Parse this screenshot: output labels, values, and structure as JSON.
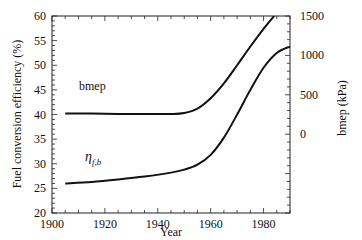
{
  "chart_data": {
    "type": "line",
    "title": "",
    "xlabel": "Year",
    "ylabel": "Fuel conversion efficiency (%)",
    "ylabel_right": "bmep (kPa)",
    "xlim": [
      1900,
      1990
    ],
    "ylim": [
      20,
      60
    ],
    "ylim_right": [
      -1000,
      1500
    ],
    "x_ticks": [
      1900,
      1920,
      1940,
      1960,
      1980
    ],
    "y_ticks": [
      20,
      25,
      30,
      35,
      40,
      45,
      50,
      55,
      60
    ],
    "y_ticks_right": [
      0,
      500,
      1000,
      1500
    ],
    "grid": false,
    "legend": "inline labels",
    "series": [
      {
        "name": "bmep",
        "axis": "right",
        "label": "bmep",
        "x": [
          1905,
          1915,
          1925,
          1935,
          1945,
          1950,
          1955,
          1960,
          1965,
          1970,
          1975,
          1980,
          1984
        ],
        "y_left_scale": [
          40.2,
          40.2,
          40.1,
          40.1,
          40.1,
          40.3,
          41.2,
          43.3,
          46.3,
          50.0,
          53.8,
          57.4,
          60.0
        ],
        "values_kpa": [
          500,
          500,
          500,
          500,
          500,
          510,
          580,
          750,
          990,
          1250,
          1500,
          1620,
          1700
        ]
      },
      {
        "name": "eta_f,b",
        "axis": "left",
        "label": "η",
        "label_sub": "f,b",
        "x": [
          1905,
          1915,
          1925,
          1935,
          1945,
          1950,
          1955,
          1960,
          1965,
          1970,
          1975,
          1980,
          1985,
          1990
        ],
        "values": [
          26.0,
          26.3,
          26.8,
          27.4,
          28.2,
          28.8,
          29.8,
          31.8,
          35.3,
          40.0,
          45.0,
          49.5,
          52.5,
          53.8
        ]
      }
    ]
  },
  "labels": {
    "xlabel": "Year",
    "ylabel": "Fuel conversion efficiency (%)",
    "ylabel_right": "bmep (kPa)",
    "bmep": "bmep",
    "eta": "η",
    "eta_sub": "f,b"
  },
  "ticks": {
    "x": [
      "1900",
      "1920",
      "1940",
      "1960",
      "1980"
    ],
    "y": [
      "20",
      "25",
      "30",
      "35",
      "40",
      "45",
      "50",
      "55",
      "60"
    ],
    "y_right": [
      "0",
      "500",
      "1000",
      "1500"
    ]
  }
}
